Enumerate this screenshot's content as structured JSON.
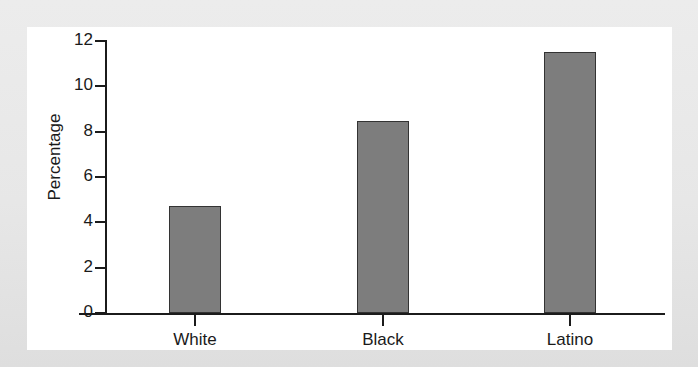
{
  "chart_data": {
    "type": "bar",
    "title": "",
    "xlabel": "",
    "ylabel": "Percentage",
    "categories": [
      "White",
      "Black",
      "Latino"
    ],
    "values": [
      4.7,
      8.45,
      11.5
    ],
    "ylim": [
      0,
      12
    ],
    "yticks": [
      0,
      2,
      4,
      6,
      8,
      10,
      12
    ],
    "ytick_labels": [
      "0",
      "2",
      "4",
      "6",
      "8",
      "10",
      "12"
    ],
    "grid": false,
    "legend": null,
    "bar_fill_color": "#7d7d7d",
    "bar_border_color": "#333333",
    "axis_color": "#1b1b1b",
    "plot_background": "#ffffff",
    "figure_background": "#e9e9e9"
  }
}
